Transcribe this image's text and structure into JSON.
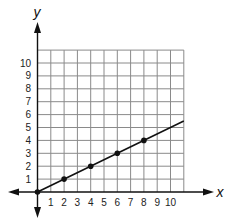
{
  "chart_data": {
    "type": "line",
    "title": "",
    "xlabel": "x",
    "ylabel": "y",
    "xlim": [
      0,
      11
    ],
    "ylim": [
      0,
      11
    ],
    "grid": true,
    "x_ticks": [
      "1",
      "2",
      "3",
      "4",
      "5",
      "6",
      "7",
      "8",
      "9",
      "10"
    ],
    "y_ticks": [
      "1",
      "2",
      "3",
      "4",
      "5",
      "6",
      "7",
      "8",
      "9",
      "10"
    ],
    "series": [
      {
        "name": "line",
        "equation": "y = 0.5x",
        "x": [
          0,
          2,
          4,
          6,
          8
        ],
        "y": [
          0,
          1,
          2,
          3,
          4
        ],
        "line_extends_to": [
          11,
          5.5
        ]
      }
    ]
  },
  "colors": {
    "axis": "#111111",
    "grid": "#8a8a8a",
    "line": "#111111"
  }
}
